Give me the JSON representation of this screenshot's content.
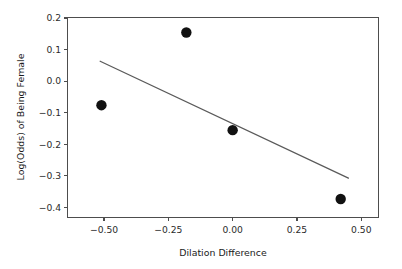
{
  "chart_data": {
    "type": "scatter",
    "title": "",
    "xlabel": "Dilation Difference",
    "ylabel": "Log(Odds) of Being Female",
    "xlim": [
      -0.64,
      0.565
    ],
    "ylim": [
      -0.43,
      0.2
    ],
    "grid": false,
    "legend": null,
    "xticks": [
      -0.5,
      -0.25,
      0.0,
      0.25,
      0.5
    ],
    "xtick_labels": [
      "−0.50",
      "−0.25",
      "0.00",
      "0.25",
      "0.50"
    ],
    "yticks": [
      0.2,
      0.1,
      0.0,
      -0.1,
      -0.2,
      -0.3,
      -0.4
    ],
    "ytick_labels": [
      "0.2",
      "0.1",
      "0.0",
      "−0.1",
      "−0.2",
      "−0.3",
      "−0.4"
    ],
    "points": [
      {
        "x": -0.51,
        "y": -0.076
      },
      {
        "x": -0.18,
        "y": 0.154
      },
      {
        "x": 0.0,
        "y": -0.155
      },
      {
        "x": 0.42,
        "y": -0.373
      }
    ],
    "marker": {
      "shape": "circle",
      "size_px": 5.2,
      "color": "#111111"
    },
    "series": [
      {
        "name": "observations",
        "x": [
          -0.51,
          -0.18,
          0.0,
          0.42
        ],
        "values": [
          -0.076,
          0.154,
          -0.155,
          -0.373
        ]
      }
    ],
    "fit_line": {
      "type": "line",
      "color": "#5a5a5a",
      "x": [
        -0.515,
        0.45
      ],
      "y": [
        0.063,
        -0.307
      ],
      "slope": -0.3834,
      "intercept": -0.1345
    },
    "axis_color": "#4d4d4d",
    "background": "#ffffff"
  },
  "labels": {
    "x_axis_title": "Dilation Difference",
    "y_axis_title": "Log(Odds) of Being Female"
  }
}
